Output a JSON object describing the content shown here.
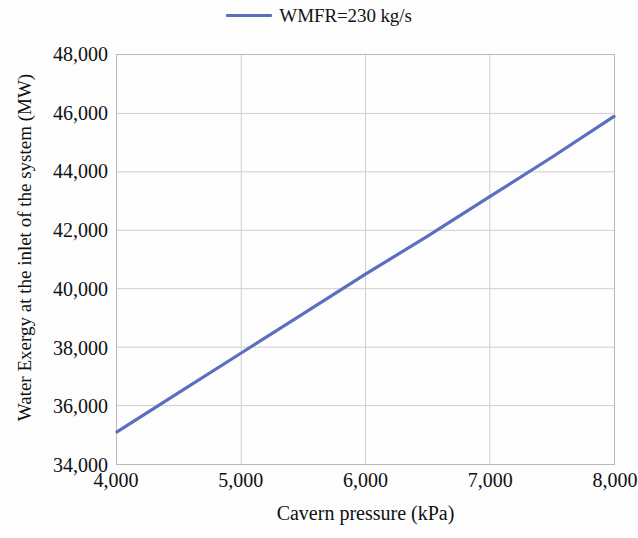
{
  "legend": {
    "position": "top-center",
    "entries": [
      {
        "label": "WMFR=230 kg/s",
        "color": "#5B6FBF",
        "marker": "line"
      }
    ]
  },
  "axes": {
    "x": {
      "title": "Cavern pressure (kPa)",
      "ticks": [
        "4,000",
        "5,000",
        "6,000",
        "7,000",
        "8,000"
      ],
      "min": 4000,
      "max": 8000,
      "step": 1000
    },
    "y": {
      "title": "Water Exergy at the inlet of the system (MW)",
      "ticks": [
        "34,000",
        "36,000",
        "38,000",
        "40,000",
        "42,000",
        "44,000",
        "46,000",
        "48,000"
      ],
      "min": 34000,
      "max": 48000,
      "step": 2000
    }
  },
  "style": {
    "line_color": "#5B6FBF",
    "grid_color": "#cfcfcf",
    "frame_color": "#b9b9b9",
    "background": "#fdfdfd",
    "text_color": "#101010"
  },
  "chart_data": {
    "type": "line",
    "title": "",
    "subtitle": "",
    "xlabel": "Cavern pressure (kPa)",
    "ylabel": "Water Exergy at the inlet of the system (MW)",
    "xlim": [
      4000,
      8000
    ],
    "ylim": [
      34000,
      48000
    ],
    "xticks": [
      4000,
      5000,
      6000,
      7000,
      8000
    ],
    "yticks": [
      34000,
      36000,
      38000,
      40000,
      42000,
      44000,
      46000,
      48000
    ],
    "grid": true,
    "legend_position": "top-center",
    "series": [
      {
        "name": "WMFR=230 kg/s",
        "color": "#5B6FBF",
        "x": [
          4000,
          4500,
          5000,
          5500,
          6000,
          6500,
          7000,
          7500,
          8000
        ],
        "values": [
          35100,
          36450,
          37800,
          39150,
          40500,
          41800,
          43150,
          44500,
          45900
        ]
      }
    ]
  }
}
